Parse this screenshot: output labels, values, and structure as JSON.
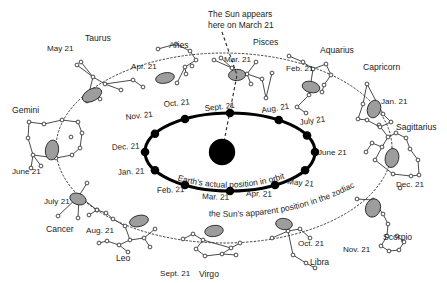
{
  "figure": {
    "title_note": "The Sun appears here on March 21",
    "title_note_lines": [
      "The Sun appears",
      "here on March 21"
    ],
    "inner_orbit_caption": "Earth's actual position in orbit",
    "outer_path_caption": "the Sun's apparent position in the zodiac",
    "background_color": "#ffffff",
    "ink_color": "#1c1c1c",
    "orbit_stroke_color": "#000000",
    "sun_color": "#000000",
    "zodiac_marker_fill": "#9d9d9d",
    "zodiac_marker_stroke": "#242424"
  },
  "sun": {
    "label": "Sun",
    "cx": 222,
    "cy": 152,
    "r": 13.2
  },
  "earth_orbit": {
    "cx": 230,
    "cy": 152,
    "rx": 85,
    "ry": 39,
    "months": [
      {
        "label": "Sept. 21",
        "angle": 270,
        "text_x": 205,
        "text_y": 111,
        "anchor": "start",
        "rotate": -6
      },
      {
        "label": "Aug. 21",
        "angle": 305,
        "text_x": 262,
        "text_y": 113,
        "anchor": "start",
        "rotate": -9
      },
      {
        "label": "July 21",
        "angle": 335,
        "text_x": 300,
        "text_y": 125,
        "anchor": "start",
        "rotate": -8
      },
      {
        "label": "June 21",
        "angle": 0,
        "text_x": 318,
        "text_y": 155,
        "anchor": "start",
        "rotate": 0
      },
      {
        "label": "May 21",
        "angle": 28,
        "text_x": 287,
        "text_y": 184,
        "anchor": "start",
        "rotate": 6
      },
      {
        "label": "Apr. 21",
        "angle": 58,
        "text_x": 246,
        "text_y": 196,
        "anchor": "start",
        "rotate": 2
      },
      {
        "label": "Mar. 21",
        "angle": 90,
        "text_x": 202,
        "text_y": 199,
        "anchor": "start",
        "rotate": 2
      },
      {
        "label": "Feb. 21",
        "angle": 122,
        "text_x": 157,
        "text_y": 193,
        "anchor": "start",
        "rotate": -2
      },
      {
        "label": "Jan. 21",
        "angle": 152,
        "text_x": 118,
        "text_y": 175,
        "anchor": "start",
        "rotate": -3
      },
      {
        "label": "Dec. 21",
        "angle": 180,
        "text_x": 112,
        "text_y": 150,
        "anchor": "start",
        "rotate": -3
      },
      {
        "label": "Nov. 21",
        "angle": 208,
        "text_x": 126,
        "text_y": 120,
        "anchor": "start",
        "rotate": -7
      },
      {
        "label": "Oct. 21",
        "angle": 238,
        "text_x": 164,
        "text_y": 107,
        "anchor": "start",
        "rotate": -6
      }
    ]
  },
  "zodiac_path": {
    "cx": 224,
    "cy": 148,
    "rx": 168,
    "ry": 95
  },
  "constellations": [
    {
      "name": "Aries",
      "date_label": "Apr. 21",
      "name_x": 169,
      "name_y": 48,
      "date_x": 131,
      "date_y": 69,
      "blob": {
        "cx": 165,
        "cy": 78,
        "rx": 9.5,
        "ry": 5.2,
        "rot": -12
      },
      "stars": [
        [
          158,
          49
        ],
        [
          176,
          44
        ],
        [
          190,
          51
        ],
        [
          196,
          60
        ],
        [
          185,
          67
        ],
        [
          186,
          74
        ],
        [
          177,
          83
        ],
        [
          192,
          66
        ]
      ],
      "links": [
        [
          0,
          1
        ],
        [
          1,
          2
        ],
        [
          2,
          3
        ],
        [
          3,
          4
        ],
        [
          4,
          5
        ],
        [
          4,
          6
        ]
      ]
    },
    {
      "name": "Taurus",
      "date_label": "May 21",
      "name_x": 85,
      "name_y": 41,
      "date_x": 47,
      "date_y": 51,
      "blob": {
        "cx": 92,
        "cy": 95,
        "rx": 10.5,
        "ry": 6.0,
        "rot": -28
      },
      "stars": [
        [
          77,
          65
        ],
        [
          81,
          62
        ],
        [
          93,
          77
        ],
        [
          105,
          84
        ],
        [
          133,
          80
        ],
        [
          143,
          87
        ],
        [
          121,
          90
        ],
        [
          100,
          99
        ],
        [
          87,
          101
        ]
      ],
      "links": [
        [
          0,
          2
        ],
        [
          1,
          2
        ],
        [
          2,
          3
        ],
        [
          3,
          4
        ],
        [
          4,
          5
        ],
        [
          3,
          6
        ],
        [
          2,
          8
        ]
      ]
    },
    {
      "name": "Gemini",
      "date_label": "June 21",
      "name_x": 12,
      "name_y": 113,
      "date_x": 12,
      "date_y": 174,
      "blob": {
        "cx": 52,
        "cy": 150,
        "rx": 6.6,
        "ry": 10.0,
        "rot": 8
      },
      "stars": [
        [
          29,
          122
        ],
        [
          44,
          124
        ],
        [
          62,
          120
        ],
        [
          78,
          122
        ],
        [
          82,
          133
        ],
        [
          80,
          148
        ],
        [
          72,
          155
        ],
        [
          56,
          158
        ],
        [
          33,
          155
        ],
        [
          28,
          138
        ],
        [
          71,
          137
        ],
        [
          31,
          168
        ],
        [
          41,
          166
        ]
      ],
      "links": [
        [
          0,
          1
        ],
        [
          1,
          2
        ],
        [
          2,
          3
        ],
        [
          3,
          4
        ],
        [
          4,
          5
        ],
        [
          5,
          6
        ],
        [
          6,
          7
        ],
        [
          7,
          8
        ],
        [
          8,
          9
        ],
        [
          9,
          0
        ],
        [
          8,
          11
        ],
        [
          8,
          12
        ]
      ]
    },
    {
      "name": "Cancer",
      "date_label": "July 21",
      "name_x": 46,
      "name_y": 232,
      "date_x": 44,
      "date_y": 204,
      "blob": {
        "cx": 78,
        "cy": 199,
        "rx": 8.4,
        "ry": 5.6,
        "rot": 20
      },
      "stars": [
        [
          87,
          183
        ],
        [
          79,
          196
        ],
        [
          58,
          216
        ],
        [
          78,
          218
        ],
        [
          97,
          210
        ]
      ],
      "links": [
        [
          0,
          1
        ],
        [
          1,
          2
        ],
        [
          1,
          3
        ],
        [
          1,
          4
        ]
      ]
    },
    {
      "name": "Leo",
      "date_label": "Aug. 21",
      "name_x": 116,
      "name_y": 261,
      "date_x": 86,
      "date_y": 233,
      "blob": {
        "cx": 139,
        "cy": 221,
        "rx": 9.6,
        "ry": 5.6,
        "rot": -14
      },
      "stars": [
        [
          89,
          215
        ],
        [
          97,
          210
        ],
        [
          106,
          213
        ],
        [
          113,
          219
        ],
        [
          125,
          226
        ],
        [
          130,
          240
        ],
        [
          119,
          245
        ],
        [
          107,
          241
        ],
        [
          99,
          243
        ],
        [
          144,
          238
        ],
        [
          155,
          229
        ],
        [
          150,
          247
        ],
        [
          128,
          252
        ]
      ],
      "links": [
        [
          0,
          1
        ],
        [
          1,
          2
        ],
        [
          2,
          3
        ],
        [
          3,
          4
        ],
        [
          4,
          5
        ],
        [
          5,
          6
        ],
        [
          6,
          7
        ],
        [
          7,
          8
        ],
        [
          5,
          9
        ],
        [
          9,
          10
        ],
        [
          9,
          11
        ],
        [
          6,
          12
        ]
      ]
    },
    {
      "name": "Virgo",
      "date_label": "Sept. 21",
      "name_x": 199,
      "name_y": 277,
      "date_x": 160,
      "date_y": 276,
      "blob": {
        "cx": 214,
        "cy": 231,
        "rx": 9.3,
        "ry": 5.6,
        "rot": -8
      },
      "stars": [
        [
          183,
          239
        ],
        [
          193,
          234
        ],
        [
          203,
          240
        ],
        [
          196,
          249
        ],
        [
          205,
          256
        ],
        [
          222,
          254
        ],
        [
          231,
          248
        ],
        [
          240,
          243
        ],
        [
          236,
          255
        ]
      ],
      "links": [
        [
          0,
          1
        ],
        [
          1,
          2
        ],
        [
          2,
          3
        ],
        [
          3,
          4
        ],
        [
          4,
          5
        ],
        [
          5,
          6
        ],
        [
          6,
          7
        ],
        [
          5,
          8
        ],
        [
          2,
          6
        ]
      ]
    },
    {
      "name": "Libra",
      "date_label": "Oct. 21",
      "name_x": 310,
      "name_y": 265,
      "date_x": 298,
      "date_y": 246,
      "blob": {
        "cx": 284,
        "cy": 224,
        "rx": 8.4,
        "ry": 5.6,
        "rot": 8
      },
      "stars": [
        [
          272,
          238
        ],
        [
          288,
          231
        ],
        [
          300,
          229
        ],
        [
          310,
          238
        ],
        [
          293,
          255
        ],
        [
          306,
          263
        ],
        [
          315,
          268
        ]
      ],
      "links": [
        [
          0,
          1
        ],
        [
          1,
          2
        ],
        [
          2,
          3
        ],
        [
          1,
          4
        ],
        [
          4,
          5
        ],
        [
          5,
          6
        ]
      ]
    },
    {
      "name": "Scorpio",
      "date_label": "Nov. 21",
      "name_x": 383,
      "name_y": 240,
      "date_x": 343,
      "date_y": 252,
      "blob": {
        "cx": 373,
        "cy": 208,
        "rx": 7.4,
        "ry": 9.3,
        "rot": 18
      },
      "stars": [
        [
          357,
          199
        ],
        [
          373,
          200
        ],
        [
          383,
          214
        ],
        [
          388,
          224
        ],
        [
          387,
          236
        ],
        [
          381,
          246
        ],
        [
          389,
          251
        ],
        [
          399,
          250
        ],
        [
          404,
          242
        ],
        [
          397,
          236
        ]
      ],
      "links": [
        [
          0,
          1
        ],
        [
          1,
          2
        ],
        [
          2,
          3
        ],
        [
          3,
          4
        ],
        [
          4,
          5
        ],
        [
          5,
          6
        ],
        [
          6,
          7
        ],
        [
          7,
          8
        ],
        [
          8,
          9
        ]
      ]
    },
    {
      "name": "Sagittarius",
      "date_label": "Dec. 21",
      "name_x": 396,
      "name_y": 130,
      "date_x": 396,
      "date_y": 187,
      "blob": {
        "cx": 392,
        "cy": 158,
        "rx": 6.8,
        "ry": 9.6,
        "rot": 12
      },
      "stars": [
        [
          379,
          125
        ],
        [
          388,
          137
        ],
        [
          396,
          133
        ],
        [
          406,
          138
        ],
        [
          382,
          147
        ],
        [
          372,
          143
        ],
        [
          366,
          152
        ],
        [
          375,
          160
        ],
        [
          393,
          174
        ],
        [
          410,
          149
        ],
        [
          418,
          160
        ],
        [
          411,
          176
        ],
        [
          419,
          175
        ],
        [
          400,
          188
        ]
      ],
      "links": [
        [
          0,
          1
        ],
        [
          1,
          2
        ],
        [
          2,
          3
        ],
        [
          1,
          4
        ],
        [
          4,
          5
        ],
        [
          5,
          6
        ],
        [
          4,
          7
        ],
        [
          7,
          8
        ],
        [
          3,
          9
        ],
        [
          9,
          10
        ],
        [
          10,
          12
        ],
        [
          12,
          11
        ],
        [
          11,
          8
        ]
      ]
    },
    {
      "name": "Capricorn",
      "date_label": "Jan. 21",
      "name_x": 363,
      "name_y": 70,
      "date_x": 381,
      "date_y": 104,
      "blob": {
        "cx": 374,
        "cy": 109,
        "rx": 6.6,
        "ry": 9.0,
        "rot": 16
      },
      "stars": [
        [
          367,
          84
        ],
        [
          363,
          104
        ],
        [
          358,
          119
        ],
        [
          367,
          120
        ],
        [
          383,
          114
        ],
        [
          391,
          122
        ],
        [
          380,
          127
        ]
      ],
      "links": [
        [
          0,
          1
        ],
        [
          1,
          2
        ],
        [
          2,
          3
        ],
        [
          0,
          4
        ],
        [
          4,
          5
        ],
        [
          5,
          6
        ],
        [
          3,
          6
        ]
      ]
    },
    {
      "name": "Aquarius",
      "date_label": "Feb. 21",
      "name_x": 320,
      "name_y": 53,
      "date_x": 286,
      "date_y": 71,
      "blob": {
        "cx": 311,
        "cy": 87,
        "rx": 9.0,
        "ry": 5.6,
        "rot": 14
      },
      "stars": [
        [
          289,
          56
        ],
        [
          303,
          62
        ],
        [
          313,
          69
        ],
        [
          326,
          64
        ],
        [
          331,
          75
        ],
        [
          324,
          85
        ],
        [
          309,
          95
        ],
        [
          297,
          107
        ],
        [
          306,
          113
        ],
        [
          322,
          92
        ]
      ],
      "links": [
        [
          0,
          1
        ],
        [
          1,
          2
        ],
        [
          2,
          3
        ],
        [
          3,
          4
        ],
        [
          4,
          5
        ],
        [
          2,
          6
        ],
        [
          6,
          7
        ],
        [
          7,
          8
        ],
        [
          5,
          9
        ]
      ]
    },
    {
      "name": "Pisces",
      "date_label": "Mar. 21",
      "name_x": 253,
      "name_y": 45,
      "date_x": 224,
      "date_y": 62,
      "blob": {
        "cx": 237,
        "cy": 75,
        "rx": 8.6,
        "ry": 5.6,
        "rot": -4
      },
      "stars": [
        [
          214,
          60
        ],
        [
          221,
          58
        ],
        [
          232,
          68
        ],
        [
          247,
          74
        ],
        [
          256,
          62
        ],
        [
          262,
          79
        ],
        [
          266,
          98
        ],
        [
          272,
          73
        ],
        [
          251,
          84
        ]
      ],
      "links": [
        [
          0,
          2
        ],
        [
          1,
          2
        ],
        [
          2,
          3
        ],
        [
          3,
          4
        ],
        [
          3,
          5
        ],
        [
          5,
          6
        ],
        [
          6,
          7
        ],
        [
          3,
          8
        ]
      ]
    }
  ]
}
